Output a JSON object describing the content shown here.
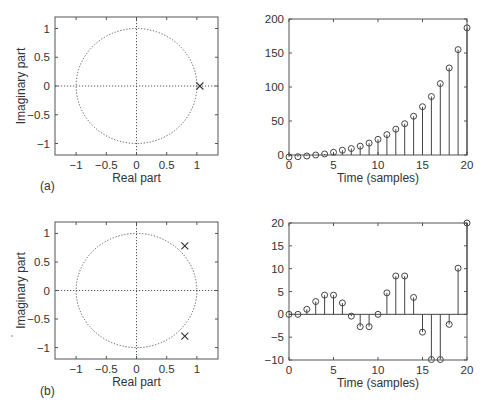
{
  "figure": {
    "panels": [
      {
        "tag": "(a)"
      },
      {
        "tag": "(b)"
      }
    ]
  },
  "chart_data": [
    {
      "id": "a-pole-zero",
      "type": "scatter",
      "title": "",
      "xlabel": "Real part",
      "ylabel": "Imaginary part",
      "xlim": [
        -1.35,
        1.35
      ],
      "ylim": [
        -1.2,
        1.2
      ],
      "xticks": [
        -1,
        -0.5,
        0,
        0.5,
        1
      ],
      "xticklabels": [
        "−1",
        "−0.5",
        "0",
        "0.5",
        "1"
      ],
      "yticks": [
        -1,
        -0.5,
        0,
        0.5,
        1
      ],
      "yticklabels": [
        "−1",
        "−0.5",
        "0",
        "0.5",
        "1"
      ],
      "unit_circle": true,
      "grid": false,
      "poles": [
        {
          "re": 1.05,
          "im": 0
        }
      ],
      "marker": "x"
    },
    {
      "id": "a-impulse-response",
      "type": "stem",
      "title": "",
      "xlabel": "Time (samples)",
      "ylabel": "",
      "xlim": [
        0,
        20
      ],
      "ylim": [
        0,
        200
      ],
      "xticks": [
        0,
        5,
        10,
        15,
        20
      ],
      "xticklabels": [
        "0",
        "5",
        "10",
        "15",
        "20"
      ],
      "yticks": [
        0,
        50,
        100,
        150,
        200
      ],
      "yticklabels": [
        "0",
        "50",
        "100",
        "150",
        "200"
      ],
      "x": [
        0,
        1,
        2,
        3,
        4,
        5,
        6,
        7,
        8,
        9,
        10,
        11,
        12,
        13,
        14,
        15,
        16,
        17,
        18,
        19,
        20
      ],
      "values": [
        -3,
        -2.5,
        -1.5,
        0,
        1.5,
        4,
        7,
        9.5,
        13,
        17.5,
        23,
        30,
        38,
        46,
        57,
        71,
        86,
        105,
        128,
        155,
        187
      ]
    },
    {
      "id": "b-pole-zero",
      "type": "scatter",
      "title": "",
      "xlabel": "Real part",
      "ylabel": "Imaginary part",
      "xlim": [
        -1.35,
        1.35
      ],
      "ylim": [
        -1.2,
        1.2
      ],
      "xticks": [
        -1,
        -0.5,
        0,
        0.5,
        1
      ],
      "xticklabels": [
        "−1",
        "−0.5",
        "0",
        "0.5",
        "1"
      ],
      "yticks": [
        -1,
        -0.5,
        0,
        0.5,
        1
      ],
      "yticklabels": [
        "−1",
        "−0.5",
        "0",
        "0.5",
        "1"
      ],
      "unit_circle": true,
      "grid": false,
      "poles": [
        {
          "re": 0.8,
          "im": 0.78
        },
        {
          "re": 0.8,
          "im": -0.8
        }
      ],
      "marker": "x"
    },
    {
      "id": "b-impulse-response",
      "type": "stem",
      "title": "",
      "xlabel": "Time (samples)",
      "ylabel": "",
      "xlim": [
        0,
        20
      ],
      "ylim": [
        -10,
        20
      ],
      "xticks": [
        0,
        5,
        10,
        15,
        20
      ],
      "xticklabels": [
        "0",
        "5",
        "10",
        "15",
        "20"
      ],
      "yticks": [
        -10,
        -5,
        0,
        5,
        10,
        15,
        20
      ],
      "yticklabels": [
        "−10",
        "−5",
        "0",
        "5",
        "10",
        "15",
        "20"
      ],
      "x": [
        0,
        1,
        2,
        3,
        4,
        5,
        6,
        7,
        8,
        9,
        10,
        11,
        12,
        13,
        14,
        15,
        16,
        17,
        18,
        19,
        20
      ],
      "values": [
        0,
        0,
        1.1,
        2.8,
        4.2,
        4.2,
        2.5,
        -0.4,
        -2.7,
        -2.7,
        0,
        4.7,
        8.4,
        8.4,
        3.7,
        -3.9,
        -9.9,
        -9.9,
        -2.2,
        10.1,
        20
      ]
    }
  ]
}
